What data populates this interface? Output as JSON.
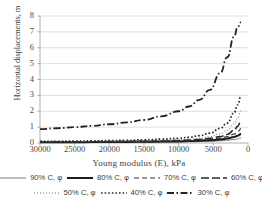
{
  "chart_data": {
    "type": "line",
    "title": "",
    "xlabel": "Young modulus (E), kPa",
    "ylabel": "Horizontal displacements, m",
    "xlim": [
      30000,
      0
    ],
    "ylim": [
      0,
      8
    ],
    "x_reversed": true,
    "grid": "horizontal",
    "legend_position": "bottom",
    "xticks": [
      "30000",
      "25000",
      "20000",
      "15000",
      "10000",
      "5000",
      "0"
    ],
    "xtick_values": [
      30000,
      25000,
      20000,
      15000,
      10000,
      5000,
      0
    ],
    "yticks": [
      "0",
      "1",
      "2",
      "3",
      "4",
      "5",
      "6",
      "7",
      "8"
    ],
    "ytick_values": [
      0,
      1,
      2,
      3,
      4,
      5,
      6,
      7,
      8
    ],
    "x": [
      30000,
      27500,
      25000,
      22500,
      20000,
      17500,
      15000,
      12500,
      10000,
      8500,
      7000,
      5500,
      4000,
      3000,
      2000,
      1500,
      1000
    ],
    "series": [
      {
        "name": "90% C, φ",
        "style": "solid-thin",
        "color": "#7a7a7a",
        "values": [
          0.03,
          0.03,
          0.03,
          0.04,
          0.04,
          0.05,
          0.05,
          0.06,
          0.07,
          0.08,
          0.09,
          0.11,
          0.14,
          0.17,
          0.22,
          0.26,
          0.32
        ]
      },
      {
        "name": "80% C, φ",
        "style": "solid-thick",
        "color": "#1c1c1c",
        "values": [
          0.05,
          0.05,
          0.05,
          0.06,
          0.06,
          0.07,
          0.08,
          0.09,
          0.1,
          0.12,
          0.14,
          0.17,
          0.22,
          0.28,
          0.38,
          0.46,
          0.57
        ]
      },
      {
        "name": "70% C, φ",
        "style": "dash-medium",
        "color": "#3a3a3a",
        "values": [
          0.06,
          0.06,
          0.07,
          0.07,
          0.08,
          0.09,
          0.1,
          0.11,
          0.13,
          0.15,
          0.18,
          0.23,
          0.31,
          0.4,
          0.56,
          0.7,
          0.9
        ]
      },
      {
        "name": "60% C, φ",
        "style": "dash-long",
        "color": "#2a2a2a",
        "values": [
          0.07,
          0.07,
          0.08,
          0.08,
          0.09,
          0.1,
          0.11,
          0.13,
          0.16,
          0.18,
          0.22,
          0.29,
          0.4,
          0.54,
          0.8,
          1.05,
          1.42
        ]
      },
      {
        "name": "50% C, φ",
        "style": "dot-fine",
        "color": "#6a6a6a",
        "values": [
          0.08,
          0.09,
          0.09,
          0.1,
          0.11,
          0.12,
          0.14,
          0.16,
          0.2,
          0.24,
          0.3,
          0.4,
          0.58,
          0.8,
          1.2,
          1.55,
          2.05
        ]
      },
      {
        "name": "40% C, φ",
        "style": "dot-bold",
        "color": "#2a2a2a",
        "values": [
          0.1,
          0.11,
          0.12,
          0.13,
          0.15,
          0.17,
          0.2,
          0.24,
          0.3,
          0.36,
          0.46,
          0.62,
          0.92,
          1.25,
          1.9,
          2.4,
          2.97
        ]
      },
      {
        "name": "30% C, φ",
        "style": "dash-dot",
        "color": "#232323",
        "values": [
          0.88,
          0.93,
          1.0,
          1.08,
          1.18,
          1.3,
          1.45,
          1.68,
          2.0,
          2.3,
          2.72,
          3.35,
          4.4,
          5.4,
          6.7,
          7.3,
          7.6
        ]
      }
    ]
  },
  "legend": {
    "rows": [
      [
        {
          "label": "90% C, φ"
        },
        {
          "label": "80% C, φ"
        },
        {
          "label": "70% C, φ"
        },
        {
          "label": "60% C, φ"
        }
      ],
      [
        {
          "label": "50% C, φ"
        },
        {
          "label": "40% C, φ"
        },
        {
          "label": "30% C, φ"
        }
      ]
    ]
  }
}
